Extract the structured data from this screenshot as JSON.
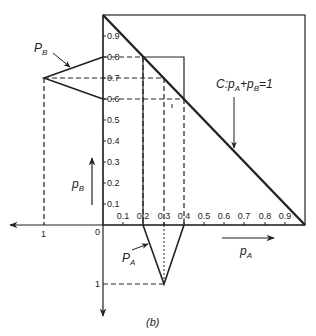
{
  "figure": {
    "caption": "(b)",
    "origin_label": "0",
    "pA_axis": {
      "ticks": [
        "0.1",
        "0.2",
        "0.3",
        "0.4",
        "0.5",
        "0.6",
        "0.7",
        "0.8",
        "0.9"
      ],
      "left_label": "1",
      "arrow_label_main": "p",
      "arrow_label_sub": "A"
    },
    "pB_axis": {
      "ticks": [
        "0.1",
        "0.2",
        "0.3",
        "0.4",
        "0.5",
        "0.6",
        "0.7",
        "0.8",
        "0.9"
      ],
      "bottom_label": "1",
      "arrow_label_main": "p",
      "arrow_label_sub": "B"
    },
    "PB_label": {
      "main": "P",
      "sub": "B"
    },
    "PA_label": {
      "main": "P",
      "sub": "A"
    },
    "constraint_label": {
      "prefix": "C:",
      "p1": "p",
      "s1": "A",
      "plus": "+",
      "p2": "p",
      "s2": "B",
      "eq": "=1"
    },
    "colors": {
      "ink": "#222222",
      "background": "#ffffff"
    }
  }
}
